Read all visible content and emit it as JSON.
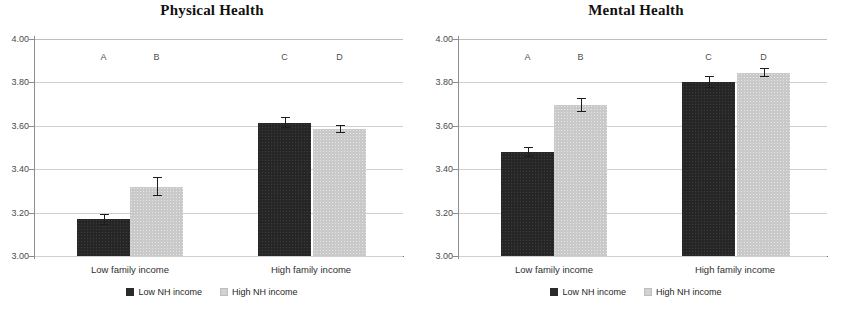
{
  "figure": {
    "panels": [
      {
        "title": "Physical Health",
        "legend": [
          {
            "label": "Low NH income",
            "style": "dark"
          },
          {
            "label": "High NH income",
            "style": "light"
          }
        ]
      },
      {
        "title": "Mental Health",
        "legend": [
          {
            "label": "Low NH income",
            "style": "dark"
          },
          {
            "label": "High NH income",
            "style": "light"
          }
        ]
      }
    ]
  },
  "chart_data": [
    {
      "type": "bar",
      "title": "Physical Health",
      "xlabel": "",
      "ylabel": "",
      "ylim": [
        3.0,
        4.0
      ],
      "yticks": [
        "3.00",
        "3.20",
        "3.40",
        "3.60",
        "3.80",
        "4.00"
      ],
      "ytick_values": [
        3.0,
        3.2,
        3.4,
        3.6,
        3.8,
        4.0
      ],
      "grid": true,
      "legend_position": "bottom",
      "categories": [
        "Low family income",
        "High family income"
      ],
      "series": [
        {
          "name": "Low NH income",
          "values": [
            3.17,
            3.615
          ],
          "errors": [
            0.025,
            0.025
          ],
          "style": "dark"
        },
        {
          "name": "High NH income",
          "values": [
            3.32,
            3.585
          ],
          "errors": [
            0.045,
            0.018
          ],
          "style": "light"
        }
      ],
      "point_labels": [
        "A",
        "B",
        "C",
        "D"
      ],
      "point_label_y": 3.94
    },
    {
      "type": "bar",
      "title": "Mental Health",
      "xlabel": "",
      "ylabel": "",
      "ylim": [
        3.0,
        4.0
      ],
      "yticks": [
        "3.00",
        "3.20",
        "3.40",
        "3.60",
        "3.80",
        "4.00"
      ],
      "ytick_values": [
        3.0,
        3.2,
        3.4,
        3.6,
        3.8,
        4.0
      ],
      "grid": true,
      "legend_position": "bottom",
      "categories": [
        "Low family income",
        "High family income"
      ],
      "series": [
        {
          "name": "Low NH income",
          "values": [
            3.48,
            3.8
          ],
          "errors": [
            0.022,
            0.028
          ],
          "style": "dark"
        },
        {
          "name": "High NH income",
          "values": [
            3.695,
            3.845
          ],
          "errors": [
            0.033,
            0.022
          ],
          "style": "light"
        }
      ],
      "point_labels": [
        "A",
        "B",
        "C",
        "D"
      ],
      "point_label_y": 3.94
    }
  ]
}
